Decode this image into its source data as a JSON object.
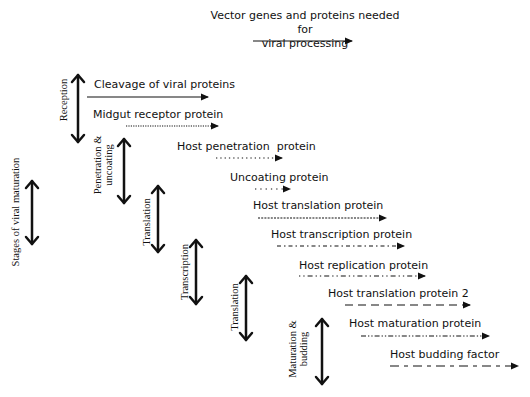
{
  "header": {
    "line1": "Vector genes and proteins needed for",
    "line2": "viral processing"
  },
  "axis_label": "Stages of viral maturation",
  "stages": [
    {
      "label": "Reception"
    },
    {
      "label_line1": "Penetration &",
      "label_line2": "uncoating"
    },
    {
      "label": "Translation"
    },
    {
      "label": "Transcription"
    },
    {
      "label": "Translation"
    },
    {
      "label_line1": "Maturation &",
      "label_line2": "budding"
    }
  ],
  "proteins": [
    {
      "label": "Cleavage of viral proteins",
      "line_style": "solid"
    },
    {
      "label": "Midgut receptor protein",
      "line_style": "dense-dotted"
    },
    {
      "label": "Host penetration  protein",
      "line_style": "dotted"
    },
    {
      "label": "Uncoating protein",
      "line_style": "sparse-dotted"
    },
    {
      "label": "Host translation protein",
      "line_style": "fine-dashed"
    },
    {
      "label": "Host transcription protein",
      "line_style": "dash-dot"
    },
    {
      "label": "Host replication protein",
      "line_style": "dot-dash-dot"
    },
    {
      "label": "Host translation protein 2",
      "line_style": "long-dashed"
    },
    {
      "label": "Host maturation protein",
      "line_style": "dash-dot-dot"
    },
    {
      "label": "Host budding factor",
      "line_style": "long-short-dashed"
    }
  ],
  "colors": {
    "ink": "#111111",
    "background": "#ffffff"
  }
}
